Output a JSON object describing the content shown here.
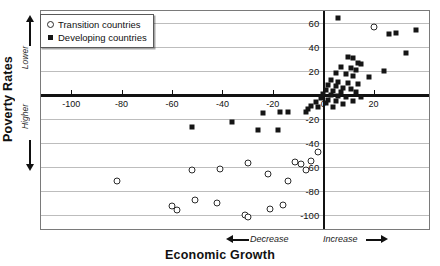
{
  "chart_data": {
    "type": "scatter",
    "title": "",
    "xlabel": "Economic Growth",
    "ylabel": "Poverty Rates",
    "xlim": [
      -112,
      42
    ],
    "ylim": [
      -112,
      70
    ],
    "grid": true,
    "legend_position": "top-left",
    "x_direction_labels": {
      "negative": "Decrease",
      "positive": "Increase"
    },
    "y_direction_labels": {
      "positive": "Lower",
      "negative": "Higher"
    },
    "xticks": [
      -100,
      -80,
      -60,
      -40,
      -20,
      0,
      20
    ],
    "xticklabels": [
      "-100",
      "-80",
      "-60",
      "-40",
      "-20",
      "0",
      "20"
    ],
    "yticks": [
      60,
      40,
      20,
      -20,
      -40,
      -60,
      -80,
      -100
    ],
    "yticklabels": [
      "60",
      "40",
      "20",
      "-20",
      "-40",
      "-60",
      "-80",
      "-100"
    ],
    "series": [
      {
        "name": "Transition countries",
        "marker": "open-circle",
        "color": "#2b2b2b",
        "points": [
          [
            20,
            57
          ],
          [
            -2,
            -48
          ],
          [
            -82,
            -72
          ],
          [
            -52,
            -63
          ],
          [
            -41,
            -62
          ],
          [
            -30,
            -57
          ],
          [
            -22,
            -66
          ],
          [
            -14,
            -72
          ],
          [
            -11,
            -56
          ],
          [
            -9,
            -58
          ],
          [
            -7,
            -63
          ],
          [
            -5,
            -55
          ],
          [
            -60,
            -93
          ],
          [
            -58,
            -96
          ],
          [
            -51,
            -88
          ],
          [
            -42,
            -90
          ],
          [
            -31,
            -100
          ],
          [
            -30,
            -102
          ],
          [
            -21,
            -95
          ],
          [
            -16,
            -92
          ]
        ]
      },
      {
        "name": "Developing countries",
        "marker": "filled-square",
        "color": "#151515",
        "points": [
          [
            6,
            64
          ],
          [
            26,
            51
          ],
          [
            29,
            52
          ],
          [
            37,
            54
          ],
          [
            33,
            35
          ],
          [
            10,
            32
          ],
          [
            12,
            31
          ],
          [
            14,
            27
          ],
          [
            15,
            26
          ],
          [
            7,
            23
          ],
          [
            11,
            22
          ],
          [
            13,
            21
          ],
          [
            24,
            20
          ],
          [
            5,
            18
          ],
          [
            9,
            17
          ],
          [
            12,
            16
          ],
          [
            18,
            15
          ],
          [
            3,
            12
          ],
          [
            6,
            11
          ],
          [
            10,
            10
          ],
          [
            14,
            9
          ],
          [
            2,
            8
          ],
          [
            5,
            7
          ],
          [
            8,
            6
          ],
          [
            11,
            5
          ],
          [
            1,
            4
          ],
          [
            4,
            3
          ],
          [
            7,
            2
          ],
          [
            13,
            2
          ],
          [
            0,
            1
          ],
          [
            3,
            0
          ],
          [
            6,
            -1
          ],
          [
            9,
            -2
          ],
          [
            15,
            -2
          ],
          [
            -1,
            -3
          ],
          [
            2,
            -4
          ],
          [
            5,
            -5
          ],
          [
            12,
            -5
          ],
          [
            -3,
            -6
          ],
          [
            1,
            -7
          ],
          [
            8,
            -8
          ],
          [
            -5,
            -9
          ],
          [
            -2,
            -10
          ],
          [
            4,
            -10
          ],
          [
            -6,
            -12
          ],
          [
            -7,
            -14
          ],
          [
            -17,
            -14
          ],
          [
            -14,
            -14
          ],
          [
            -24,
            -15
          ],
          [
            -36,
            -23
          ],
          [
            -52,
            -27
          ],
          [
            -26,
            -29
          ],
          [
            -18,
            -29
          ]
        ]
      }
    ]
  },
  "legend": {
    "items": [
      {
        "label": "Transition countries",
        "marker": "open-circle"
      },
      {
        "label": "Developing countries",
        "marker": "filled-square"
      }
    ]
  },
  "axes": {
    "y_title": "Poverty Rates",
    "y_upper_label": "Lower",
    "y_lower_label": "Higher",
    "x_title": "Economic Growth",
    "x_left_label": "Decrease",
    "x_right_label": "Increase"
  }
}
